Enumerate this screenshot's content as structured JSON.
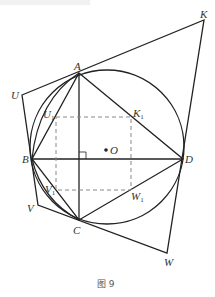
{
  "figure": {
    "caption": "图 9",
    "labels": {
      "A": "A",
      "B": "B",
      "C": "C",
      "D": "D",
      "O": "O",
      "K": "K",
      "U": "U",
      "V": "V",
      "W": "W",
      "K1": "K",
      "U1": "U",
      "V1": "V",
      "W1": "W",
      "sub1": "1"
    },
    "colors": {
      "line": "#222222",
      "dash": "#888888",
      "label": "#333333"
    }
  }
}
